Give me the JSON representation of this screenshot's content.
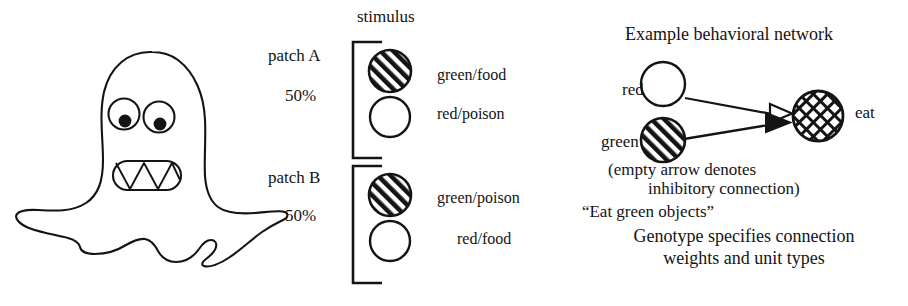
{
  "figure": {
    "background": "#ffffff",
    "ink_color": "#141414"
  },
  "creature": {
    "name": "organism-blob",
    "description": "hand-drawn amoeba-like creature with two eyes and a toothy mouth",
    "eyes": 2,
    "teeth": 4
  },
  "stimulus": {
    "header": "stimulus",
    "patches": [
      {
        "name": "patch A",
        "probability": "50%",
        "items": [
          {
            "fill": "hatched",
            "label": "green/food"
          },
          {
            "fill": "empty",
            "label": "red/poison"
          }
        ]
      },
      {
        "name": "patch B",
        "probability": "50%",
        "items": [
          {
            "fill": "hatched",
            "label": "green/poison"
          },
          {
            "fill": "empty",
            "label": "red/food"
          }
        ]
      }
    ]
  },
  "network": {
    "title": "Example behavioral network",
    "nodes": [
      {
        "id": "red",
        "label": "red",
        "fill": "empty"
      },
      {
        "id": "green",
        "label": "green",
        "fill": "hatched"
      },
      {
        "id": "eat",
        "label": "eat",
        "fill": "crosshatched"
      }
    ],
    "connections": [
      {
        "from": "red",
        "to": "eat",
        "arrow": "empty",
        "type": "inhibitory"
      },
      {
        "from": "green",
        "to": "eat",
        "arrow": "filled",
        "type": "excitatory"
      }
    ],
    "caption_line1": "(empty arrow denotes",
    "caption_line2": "inhibitory connection)",
    "caption_line3": "“Eat green objects”",
    "caption_line4": "Genotype specifies connection",
    "caption_line5": "weights and unit types"
  }
}
